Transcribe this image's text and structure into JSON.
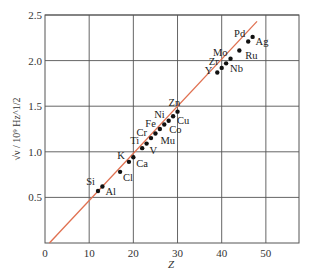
{
  "chart_data": {
    "type": "scatter",
    "title": "",
    "xlabel": "Z",
    "ylabel": "√ν / 10⁹ Hz^1/2",
    "xlim": [
      0,
      57.5
    ],
    "ylim": [
      0,
      2.5
    ],
    "x_ticks": [
      0,
      10,
      20,
      30,
      40,
      50
    ],
    "x_tick_labels": [
      "0",
      "10",
      "20",
      "30",
      "40",
      "50"
    ],
    "y_ticks": [
      0.5,
      1.0,
      1.5,
      2.0,
      2.5
    ],
    "y_tick_labels": [
      "0.5",
      "1.0",
      "1.5",
      "2.0",
      "2.5"
    ],
    "grid": true,
    "fit_line": {
      "color": "#e07050",
      "x0": 1,
      "y0": 0,
      "x1": 48,
      "y1": 2.43
    },
    "marker_color": "#111111",
    "series": [
      {
        "name": "Moseley data",
        "points": [
          {
            "label": "Al",
            "x": 13,
            "y": 0.62
          },
          {
            "label": "Si",
            "x": 12,
            "y": 0.57
          },
          {
            "label": "Cl",
            "x": 17,
            "y": 0.78
          },
          {
            "label": "K",
            "x": 19,
            "y": 0.89
          },
          {
            "label": "Ca",
            "x": 20,
            "y": 0.94
          },
          {
            "label": "Ti",
            "x": 22,
            "y": 1.04
          },
          {
            "label": "V",
            "x": 23,
            "y": 1.09
          },
          {
            "label": "Cr",
            "x": 24,
            "y": 1.15
          },
          {
            "label": "Mu",
            "x": 25,
            "y": 1.2
          },
          {
            "label": "Fe",
            "x": 26,
            "y": 1.25
          },
          {
            "label": "Co",
            "x": 27,
            "y": 1.3
          },
          {
            "label": "Ni",
            "x": 28,
            "y": 1.34
          },
          {
            "label": "Cu",
            "x": 29,
            "y": 1.39
          },
          {
            "label": "Zn",
            "x": 30,
            "y": 1.44
          },
          {
            "label": "Y",
            "x": 39,
            "y": 1.87
          },
          {
            "label": "Zr",
            "x": 40,
            "y": 1.92
          },
          {
            "label": "Nb",
            "x": 41,
            "y": 1.97
          },
          {
            "label": "Mo",
            "x": 42,
            "y": 2.02
          },
          {
            "label": "Ru",
            "x": 44,
            "y": 2.11
          },
          {
            "label": "Pd",
            "x": 46,
            "y": 2.21
          },
          {
            "label": "Ag",
            "x": 47,
            "y": 2.26
          }
        ]
      }
    ]
  }
}
